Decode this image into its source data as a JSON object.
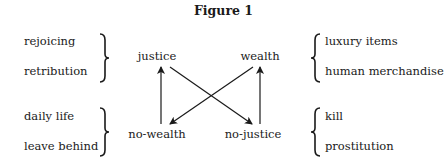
{
  "figure": {
    "title": "Figure 1",
    "nodes": {
      "top_left": "justice",
      "top_right": "wealth",
      "bottom_left": "no-wealth",
      "bottom_right": "no-justice"
    },
    "left_groups": [
      {
        "items": [
          "rejoicing",
          "retribution"
        ]
      },
      {
        "items": [
          "daily life",
          "leave behind"
        ]
      }
    ],
    "right_groups": [
      {
        "items": [
          "luxury items",
          "human merchandise"
        ]
      },
      {
        "items": [
          "kill",
          "prostitution"
        ]
      }
    ],
    "edges": [
      {
        "from": "no-wealth",
        "to": "justice"
      },
      {
        "from": "no-justice",
        "to": "wealth"
      },
      {
        "from": "justice",
        "to": "no-justice"
      },
      {
        "from": "wealth",
        "to": "no-wealth"
      }
    ]
  }
}
